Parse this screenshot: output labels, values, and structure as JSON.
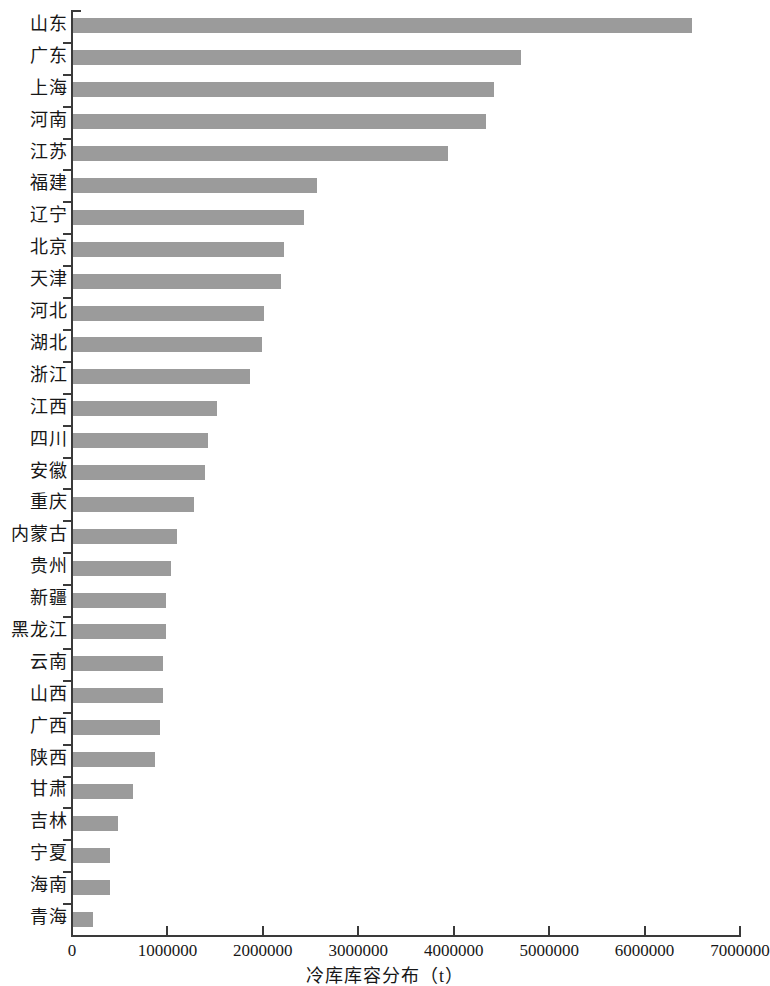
{
  "chart_data": {
    "type": "bar",
    "orientation": "horizontal",
    "title": "",
    "xlabel": "冷库库容分布（t）",
    "ylabel": "",
    "xlim": [
      0,
      7000000
    ],
    "xticks": [
      "0",
      "1000000",
      "2000000",
      "3000000",
      "4000000",
      "5000000",
      "6000000",
      "7000000"
    ],
    "xtick_values": [
      0,
      1000000,
      2000000,
      3000000,
      4000000,
      5000000,
      6000000,
      7000000
    ],
    "grid": false,
    "legend": null,
    "bar_color": "#9b9b9b",
    "axis_color": "#3a3a3a",
    "categories": [
      "山东",
      "广东",
      "上海",
      "河南",
      "江苏",
      "福建",
      "辽宁",
      "北京",
      "天津",
      "河北",
      "湖北",
      "浙江",
      "江西",
      "四川",
      "安徽",
      "重庆",
      "内蒙古",
      "贵州",
      "新疆",
      "黑龙江",
      "云南",
      "山西",
      "广西",
      "陕西",
      "甘肃",
      "吉林",
      "宁夏",
      "海南",
      "青海"
    ],
    "values": [
      6500000,
      4700000,
      4420000,
      4340000,
      3940000,
      2570000,
      2430000,
      2220000,
      2190000,
      2010000,
      1990000,
      1870000,
      1520000,
      1430000,
      1390000,
      1280000,
      1100000,
      1040000,
      985000,
      985000,
      950000,
      950000,
      920000,
      870000,
      640000,
      480000,
      400000,
      400000,
      220000
    ]
  }
}
